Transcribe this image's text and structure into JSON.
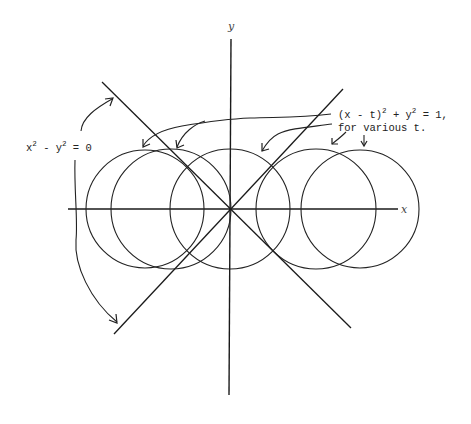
{
  "diagram": {
    "axes": {
      "x_label": "x",
      "y_label": "y",
      "origin_px": [
        230,
        209
      ]
    },
    "asymptotes": {
      "equation_label": {
        "base1": "x",
        "sup1": "2",
        "mid": " - y",
        "sup2": "2",
        "tail": " = 0"
      },
      "lines": [
        "y = x",
        "y = -x"
      ]
    },
    "circles": {
      "equation_label": {
        "part1": "(x - t)",
        "sup1": "2",
        "part2": " + y",
        "sup2": "2",
        "part3": " = 1,",
        "line2": "for various t."
      },
      "radius_px": 60,
      "centers_px": [
        145,
        171,
        230,
        316,
        360
      ]
    },
    "colors": {
      "ink": "#1a1a1a",
      "background": "#ffffff"
    }
  }
}
